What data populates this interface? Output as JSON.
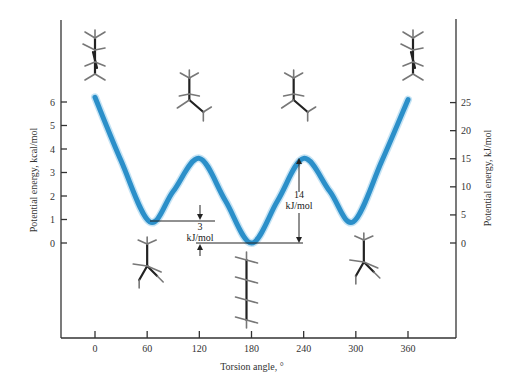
{
  "chart_data": {
    "type": "line",
    "title": "",
    "xlabel": "Torsion angle, °",
    "ylabel": "Potential energy, kcal/mol",
    "ylabel_right": "Potential energy, kJ/mol",
    "xlim": [
      -30,
      390
    ],
    "ylim": [
      -4,
      9.3
    ],
    "x_ticks": [
      0,
      60,
      120,
      180,
      240,
      300,
      360
    ],
    "y_ticks_left": [
      0,
      1,
      2,
      3,
      4,
      5,
      6
    ],
    "y_ticks_right": [
      0,
      5,
      10,
      15,
      20,
      25
    ],
    "grid": false,
    "legend": null,
    "series": [
      {
        "name": "Butane torsional potential energy",
        "color": "#2b8fc9",
        "x": [
          0,
          30,
          63,
          90,
          120,
          150,
          180,
          210,
          240,
          270,
          297,
          330,
          360
        ],
        "values": [
          6.2,
          3.5,
          0.9,
          2.2,
          3.6,
          1.8,
          0.0,
          1.8,
          3.6,
          2.2,
          0.9,
          3.5,
          6.1
        ]
      }
    ],
    "annotations": [
      {
        "text_value": "3",
        "text_unit": "kJ/mol",
        "description": "energy difference between gauche (60°) and anti (180°) conformations"
      },
      {
        "text_value": "14",
        "text_unit": "kJ/mol",
        "description": "barrier between anti (180°) and eclipsed (240°)"
      }
    ],
    "conformations": [
      {
        "angle": 0,
        "name": "eclipsed (syn)",
        "position": "above"
      },
      {
        "angle": 60,
        "name": "gauche",
        "position": "below"
      },
      {
        "angle": 120,
        "name": "eclipsed",
        "position": "above"
      },
      {
        "angle": 180,
        "name": "anti",
        "position": "below"
      },
      {
        "angle": 240,
        "name": "eclipsed",
        "position": "above"
      },
      {
        "angle": 300,
        "name": "gauche",
        "position": "below"
      },
      {
        "angle": 360,
        "name": "eclipsed (syn)",
        "position": "above"
      }
    ]
  },
  "labels": {
    "x_axis": "Torsion angle, °",
    "y_axis_left": "Potential energy, kcal/mol",
    "y_axis_right": "Potential energy, kJ/mol",
    "annot_3_value": "3",
    "annot_3_unit": "kJ/mol",
    "annot_14_value": "14",
    "annot_14_unit": "kJ/mol"
  }
}
